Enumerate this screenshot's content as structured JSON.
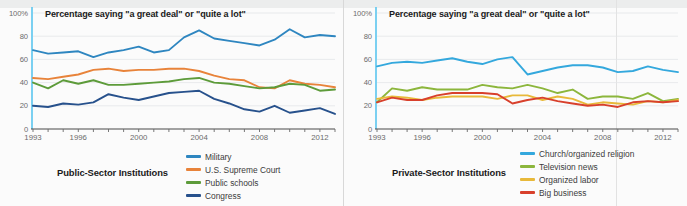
{
  "figure": {
    "background": "#fbfbfb",
    "panel_divider_color": "#d8d8d8"
  },
  "chart_data": [
    {
      "type": "line",
      "id": "public-sector",
      "title": "Percentage saying \"a great deal\" or \"quite a lot\"",
      "panel_label": "Public-Sector Institutions",
      "xlabel": "",
      "ylabel": "",
      "ylim": [
        0,
        100
      ],
      "yticks": [
        0,
        20,
        40,
        60,
        80,
        100
      ],
      "ytick_labels": [
        "0",
        "20",
        "40",
        "60",
        "80",
        "100%"
      ],
      "xlim": [
        1993,
        2013
      ],
      "xticks": [
        1993,
        1996,
        2000,
        2004,
        2008,
        2012
      ],
      "xtick_labels": [
        "1993",
        "1996",
        "2000",
        "2004",
        "2008",
        "2012"
      ],
      "grid": "horizontal",
      "legend_position": "bottom-right",
      "x": [
        1993,
        1994,
        1995,
        1996,
        1997,
        1998,
        1999,
        2000,
        2001,
        2002,
        2003,
        2004,
        2005,
        2006,
        2007,
        2008,
        2009,
        2010,
        2011,
        2012,
        2013
      ],
      "series": [
        {
          "name": "Military",
          "color": "#2e86c0",
          "values": [
            68,
            65,
            66,
            67,
            62,
            66,
            68,
            71,
            66,
            68,
            79,
            85,
            78,
            76,
            74,
            72,
            77,
            86,
            79,
            81,
            80
          ]
        },
        {
          "name": "U.S. Supreme Court",
          "color": "#e8833a",
          "values": [
            44,
            43,
            45,
            47,
            51,
            52,
            50,
            51,
            51,
            52,
            52,
            50,
            46,
            43,
            42,
            36,
            35,
            42,
            39,
            38,
            36
          ]
        },
        {
          "name": "Public schools",
          "color": "#5d9b3a",
          "values": [
            40,
            35,
            42,
            39,
            42,
            38,
            38,
            39,
            40,
            41,
            43,
            44,
            40,
            39,
            37,
            35,
            36,
            39,
            38,
            33,
            34
          ]
        },
        {
          "name": "Congress",
          "color": "#27518c",
          "values": [
            20,
            19,
            22,
            21,
            23,
            30,
            27,
            25,
            28,
            31,
            32,
            33,
            26,
            22,
            17,
            15,
            20,
            14,
            16,
            18,
            13
          ]
        }
      ]
    },
    {
      "type": "line",
      "id": "private-sector",
      "title": "Percentage saying \"a great deal\" or \"quite a lot\"",
      "panel_label": "Private-Sector Institutions",
      "xlabel": "",
      "ylabel": "",
      "ylim": [
        0,
        100
      ],
      "yticks": [
        0,
        20,
        40,
        60,
        80,
        100
      ],
      "ytick_labels": [
        "0",
        "20",
        "40",
        "60",
        "80",
        "100%"
      ],
      "xlim": [
        1993,
        2013
      ],
      "xticks": [
        1993,
        1996,
        2000,
        2004,
        2008,
        2012
      ],
      "xtick_labels": [
        "1993",
        "1996",
        "2000",
        "2004",
        "2008",
        "2012"
      ],
      "grid": "horizontal",
      "legend_position": "bottom-right",
      "x": [
        1993,
        1994,
        1995,
        1996,
        1997,
        1998,
        1999,
        2000,
        2001,
        2002,
        2003,
        2004,
        2005,
        2006,
        2007,
        2008,
        2009,
        2010,
        2011,
        2012,
        2013
      ],
      "series": [
        {
          "name": "Church/organized religion",
          "color": "#34a8dd",
          "values": [
            54,
            57,
            58,
            57,
            59,
            61,
            58,
            56,
            60,
            62,
            47,
            50,
            53,
            55,
            55,
            53,
            49,
            50,
            54,
            51,
            49,
            51
          ]
        },
        {
          "name": "Television news",
          "color": "#8cb63c",
          "values": [
            23,
            35,
            33,
            36,
            34,
            34,
            34,
            38,
            36,
            35,
            38,
            35,
            31,
            34,
            26,
            28,
            28,
            26,
            31,
            24,
            26
          ]
        },
        {
          "name": "Organized labor",
          "color": "#e8b93a",
          "values": [
            26,
            28,
            27,
            25,
            27,
            28,
            28,
            28,
            26,
            29,
            29,
            25,
            28,
            26,
            21,
            23,
            22,
            21,
            24,
            23,
            25
          ]
        },
        {
          "name": "Big business",
          "color": "#d8402c",
          "values": [
            23,
            27,
            25,
            25,
            29,
            31,
            31,
            31,
            30,
            22,
            25,
            27,
            24,
            22,
            20,
            21,
            19,
            23,
            24,
            23,
            24
          ]
        }
      ]
    }
  ]
}
